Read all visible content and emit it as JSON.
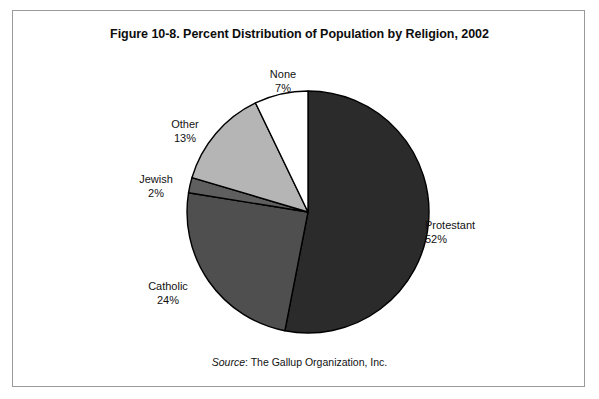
{
  "figure": {
    "title": "Figure 10-8. Percent Distribution of Population by Religion, 2002",
    "source_keyword": "Source",
    "source_separator": ": ",
    "source_text": "The Gallup Organization, Inc."
  },
  "chart_data": {
    "type": "pie",
    "title": "Figure 10-8. Percent Distribution of Population by Religion, 2002",
    "xlabel": "",
    "ylabel": "",
    "units": "percent",
    "total": 98,
    "start_angle_deg": 0,
    "direction": "clockwise",
    "legend": "none",
    "grid": false,
    "labels_outside": true,
    "categories": [
      "Protestant",
      "Catholic",
      "Jewish",
      "Other",
      "None"
    ],
    "values": [
      52,
      24,
      2,
      13,
      7
    ],
    "slices": [
      {
        "name": "Protestant",
        "value": 52,
        "value_label": "52%",
        "color": "#2b2b2b",
        "label_position": "right"
      },
      {
        "name": "Catholic",
        "value": 24,
        "value_label": "24%",
        "color": "#4f4f4f",
        "label_position": "lower-left"
      },
      {
        "name": "Jewish",
        "value": 2,
        "value_label": "2%",
        "color": "#5f5f5f",
        "label_position": "left"
      },
      {
        "name": "Other",
        "value": 13,
        "value_label": "13%",
        "color": "#b5b5b5",
        "label_position": "upper-left"
      },
      {
        "name": "None",
        "value": 7,
        "value_label": "7%",
        "color": "#ffffff",
        "label_position": "top"
      }
    ],
    "slice_outline_color": "#000000",
    "background_color": "#ffffff",
    "frame_color": "#9a9a9a"
  }
}
